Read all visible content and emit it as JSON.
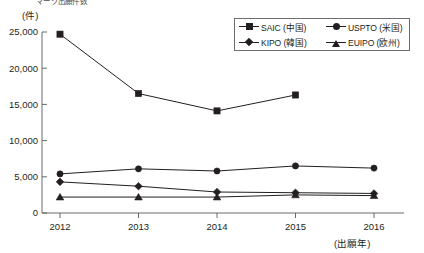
{
  "clipped_header": "マーク出願件数",
  "axes": {
    "y_unit_label": "(件)",
    "x_unit_label": "(出願年)",
    "y_ticks": [
      "0",
      "5,000",
      "10,000",
      "15,000",
      "20,000",
      "25,000"
    ],
    "x_ticks": [
      "2012",
      "2013",
      "2014",
      "2015",
      "2016"
    ]
  },
  "legend": {
    "entries": [
      {
        "label": "SAIC (中国)",
        "marker": "square-marker-icon"
      },
      {
        "label": "USPTO (米国)",
        "marker": "circle-marker-icon"
      },
      {
        "label": "KIPO (韓国)",
        "marker": "diamond-marker-icon"
      },
      {
        "label": "EUIPO (欧州)",
        "marker": "triangle-marker-icon"
      }
    ]
  },
  "chart_data": {
    "type": "line",
    "title": "",
    "xlabel": "(出願年)",
    "ylabel": "(件)",
    "categories": [
      "2012",
      "2013",
      "2014",
      "2015",
      "2016"
    ],
    "x": [
      2012,
      2013,
      2014,
      2015,
      2016
    ],
    "ylim": [
      0,
      25000
    ],
    "ytick_step": 5000,
    "grid": false,
    "legend_position": "top-right",
    "series": [
      {
        "name": "SAIC (中国)",
        "marker": "square",
        "values": [
          24700,
          16500,
          14100,
          16300,
          null
        ]
      },
      {
        "name": "USPTO (米国)",
        "marker": "circle",
        "values": [
          5400,
          6100,
          5800,
          6500,
          6200
        ]
      },
      {
        "name": "KIPO (韓国)",
        "marker": "diamond",
        "values": [
          4300,
          3700,
          2900,
          2800,
          2700
        ]
      },
      {
        "name": "EUIPO (欧州)",
        "marker": "triangle",
        "values": [
          2200,
          2200,
          2200,
          2500,
          2400
        ]
      }
    ]
  }
}
